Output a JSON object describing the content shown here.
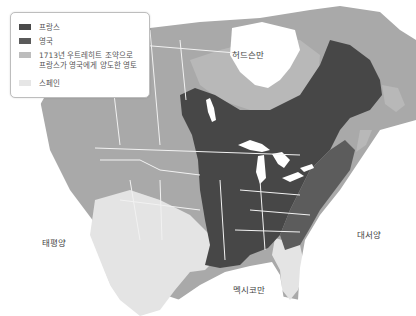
{
  "legend": {
    "items": [
      {
        "label": "프랑스",
        "color": "#4a4a4a"
      },
      {
        "label": "영국",
        "color": "#5a5a5a"
      },
      {
        "label_line1": "1713년 우트레히트 조약으로",
        "label_line2": "프랑스가 영국에게 양도한 영토",
        "color": "#bdbdbd"
      },
      {
        "label": "스페인",
        "color": "#e6e6e6"
      }
    ]
  },
  "map_labels": {
    "hudson_bay": "허드슨만",
    "pacific": "태평양",
    "atlantic": "대서양",
    "gulf_of_mexico": "멕시코만"
  },
  "colors": {
    "france": "#474747",
    "britain": "#5c5c5c",
    "ceded": "#b8b8b8",
    "spain": "#e4e4e4",
    "other_land": "#a9a9a9",
    "water": "#ffffff",
    "borders": "#f2f2f2"
  }
}
